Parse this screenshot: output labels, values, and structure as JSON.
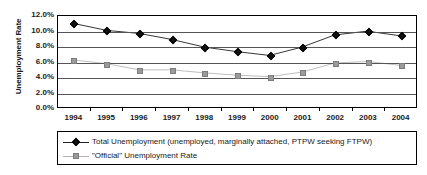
{
  "chart_data": {
    "type": "line",
    "title": "",
    "xlabel": "",
    "ylabel": "Unemployment Rate",
    "categories": [
      "1994",
      "1995",
      "1996",
      "1997",
      "1998",
      "1999",
      "2000",
      "2001",
      "2002",
      "2003",
      "2004"
    ],
    "ylim": [
      0,
      12
    ],
    "y_tick_labels": [
      "12.0%",
      "10.0%",
      "8.0%",
      "6.0%",
      "4.0%",
      "2.0%",
      "0.0%"
    ],
    "y_tick_values": [
      12,
      10,
      8,
      6,
      4,
      2,
      0
    ],
    "grid": true,
    "legend_position": "bottom",
    "series": [
      {
        "name": "Total Unemployment (unemployed, marginally attached, PTPW seeking FTPW)",
        "marker": "diamond",
        "color": "#111111",
        "line_color": "#333333",
        "values": [
          11.0,
          10.1,
          9.7,
          8.9,
          7.9,
          7.3,
          6.8,
          7.9,
          9.5,
          10.0,
          9.4
        ]
      },
      {
        "name": "\"Official\" Unemployment Rate",
        "marker": "square",
        "color": "#9b9b9b",
        "line_color": "#bdbdbd",
        "values": [
          6.2,
          5.7,
          4.9,
          4.9,
          4.5,
          4.2,
          4.0,
          4.6,
          5.8,
          6.0,
          5.5
        ]
      }
    ]
  },
  "axis": {
    "y_title": "Unemployment Rate"
  },
  "legend": {
    "items": [
      {
        "label": "Total Unemployment (unemployed, marginally attached, PTPW seeking FTPW)"
      },
      {
        "label": "\"Official\" Unemployment Rate"
      }
    ]
  },
  "colors": {
    "total_series": "#111111",
    "official_series": "#9b9b9b",
    "gridline": "#555555",
    "axis": "#000000",
    "text": "#1a1a1a",
    "background": "#ffffff"
  }
}
